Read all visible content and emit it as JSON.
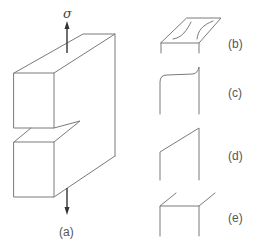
{
  "figure": {
    "panels": [
      {
        "id": "a",
        "label": "(a)",
        "description": "Notched specimen block under tensile stress"
      },
      {
        "id": "b",
        "label": "(b)"
      },
      {
        "id": "c",
        "label": "(c)"
      },
      {
        "id": "d",
        "label": "(d)"
      },
      {
        "id": "e",
        "label": "(e)"
      }
    ],
    "stress_symbol": "σ",
    "colors": {
      "line": "#7a7a7a",
      "arrow": "#333333",
      "text": "#555555"
    }
  }
}
